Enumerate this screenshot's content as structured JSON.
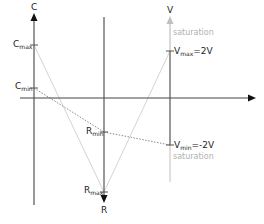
{
  "diagram": {
    "axes": {
      "c_axis": {
        "label": "C",
        "x": 34,
        "y_top": 4,
        "y_bottom": 205,
        "direction": "up"
      },
      "r_axis": {
        "label": "R",
        "x": 104,
        "y_top": 17,
        "y_bottom": 202,
        "direction": "down"
      },
      "v_axis": {
        "label": "V",
        "x": 170,
        "y_top": 8,
        "y_bottom": 182,
        "direction": "up",
        "upper_color": "#b8b8b8"
      },
      "h_axis": {
        "y": 98,
        "x_left": 20,
        "x_right": 256,
        "direction": "right"
      }
    },
    "labels": {
      "c_axis": "C",
      "r_axis": "R",
      "v_axis": "V",
      "c_max_main": "C",
      "c_max_sub": "max",
      "c_min_main": "C",
      "c_min_sub": "min",
      "r_min_main": "R",
      "r_min_sub": "min",
      "r_max_main": "R",
      "r_max_sub": "max",
      "v_max_main": "V",
      "v_max_sub": "max",
      "v_max_value": "=2V",
      "v_min_main": "V",
      "v_min_sub": "min",
      "v_min_value": "=-2V",
      "saturation_top": "saturation",
      "saturation_bottom": "saturation"
    },
    "points": {
      "c_max": [
        34,
        45
      ],
      "c_min": [
        34,
        88
      ],
      "r_min": [
        104,
        132
      ],
      "r_max": [
        104,
        192
      ],
      "v_max": [
        170,
        51
      ],
      "v_min": [
        170,
        145
      ]
    },
    "connections": [
      {
        "from": "c_max",
        "to": "r_max",
        "style": "solid-light"
      },
      {
        "from": "r_max",
        "to": "v_max",
        "style": "solid-light"
      },
      {
        "from": "c_min",
        "to": "r_min",
        "style": "dotted"
      },
      {
        "from": "r_min",
        "to": "v_min",
        "style": "dotted"
      }
    ],
    "colors": {
      "axis": "#555555",
      "light_line": "#d4d4d4",
      "dotted_line": "#8a8a8a",
      "saturation_text": "#b0b0b0"
    }
  }
}
